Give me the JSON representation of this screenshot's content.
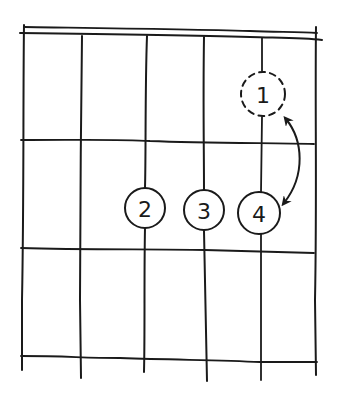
{
  "diagram": {
    "type": "guitar-chord-fretboard",
    "strings": 6,
    "frets_shown": 3,
    "has_nut": true,
    "ink_color": "#1a1a1a",
    "background_color": "#ffffff",
    "fingers": [
      {
        "label": "1",
        "string": 5,
        "fret": 1,
        "style": "dashed",
        "meaning": "alternate position"
      },
      {
        "label": "2",
        "string": 3,
        "fret": 2,
        "style": "solid"
      },
      {
        "label": "3",
        "string": 4,
        "fret": 2,
        "style": "solid"
      },
      {
        "label": "4",
        "string": 5,
        "fret": 2,
        "style": "solid"
      }
    ],
    "annotations": [
      {
        "type": "double-headed-curved-arrow",
        "from_finger": "1",
        "to_finger": "4"
      }
    ]
  }
}
